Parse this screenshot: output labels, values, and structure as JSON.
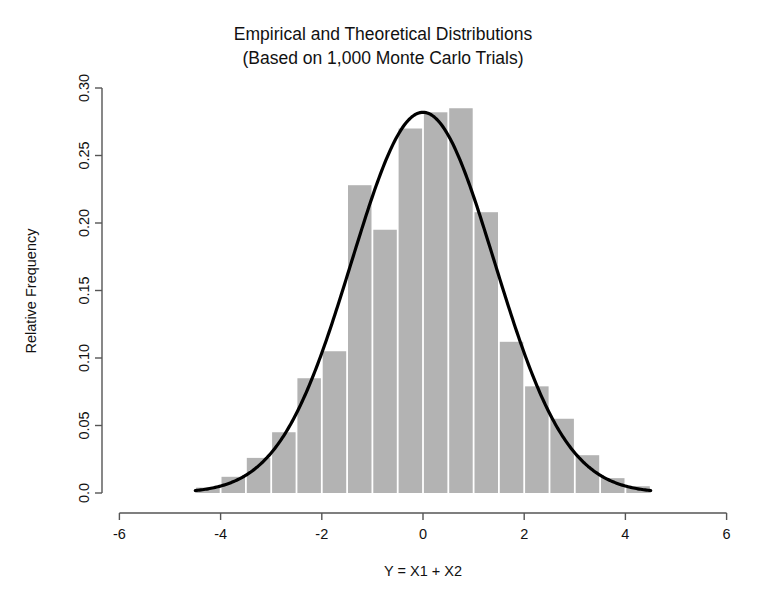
{
  "chart_data": {
    "type": "bar",
    "title": "Empirical and Theoretical Distributions",
    "subtitle": "(Based on 1,000 Monte Carlo Trials)",
    "title_line1": "Empirical and Theoretical Distributions",
    "title_line2": "(Based on 1,000 Monte Carlo Trials)",
    "xlabel": "Y = X1 + X2",
    "ylabel": "Relative Frequency",
    "xlim": [
      -6,
      6
    ],
    "ylim": [
      0.0,
      0.3
    ],
    "grid": false,
    "legend": "none",
    "bar_color": "#b3b3b3",
    "curve_color": "#000000",
    "axis_color": "#555555",
    "xticks": [
      -6,
      -4,
      -2,
      0,
      2,
      4,
      6
    ],
    "xtick_labels": [
      "-6",
      "-4",
      "-2",
      "0",
      "2",
      "4",
      "6"
    ],
    "yticks": [
      0.0,
      0.05,
      0.1,
      0.15,
      0.2,
      0.25,
      0.3
    ],
    "ytick_labels": [
      "0.0",
      "0.05",
      "0.10",
      "0.15",
      "0.20",
      "0.25",
      "0.30"
    ],
    "bin_width": 0.5,
    "bin_starts": [
      -4.5,
      -4.0,
      -3.5,
      -3.0,
      -2.5,
      -2.0,
      -1.5,
      -1.0,
      -0.5,
      0.0,
      0.5,
      1.0,
      1.5,
      2.0,
      2.5,
      3.0,
      3.5,
      4.0
    ],
    "bin_centers": [
      -4.25,
      -3.75,
      -3.25,
      -2.75,
      -2.25,
      -1.75,
      -1.25,
      -0.75,
      -0.25,
      0.25,
      0.75,
      1.25,
      1.75,
      2.25,
      2.75,
      3.25,
      3.75,
      4.25
    ],
    "categories": [
      "-4.5",
      "-4.0",
      "-3.5",
      "-3.0",
      "-2.5",
      "-2.0",
      "-1.5",
      "-1.0",
      "-0.5",
      "0.0",
      "0.5",
      "1.0",
      "1.5",
      "2.0",
      "2.5",
      "3.0",
      "3.5",
      "4.0"
    ],
    "values": [
      0.004,
      0.012,
      0.026,
      0.045,
      0.085,
      0.105,
      0.228,
      0.195,
      0.27,
      0.282,
      0.285,
      0.208,
      0.112,
      0.079,
      0.055,
      0.028,
      0.011,
      0.005
    ],
    "series": [
      {
        "name": "Empirical (histogram)",
        "values": [
          0.004,
          0.012,
          0.026,
          0.045,
          0.085,
          0.105,
          0.228,
          0.195,
          0.27,
          0.282,
          0.285,
          0.208,
          0.112,
          0.079,
          0.055,
          0.028,
          0.011,
          0.005
        ]
      },
      {
        "name": "Theoretical (normal density)",
        "type": "line",
        "mean": 0,
        "sd": 1.4142,
        "peak_value": 0.282,
        "x_range": [
          -4.5,
          4.5
        ]
      }
    ],
    "annotations": []
  },
  "figure": {
    "title_line1": "Empirical and Theoretical Distributions",
    "title_line2": "(Based on 1,000 Monte Carlo Trials)",
    "xlabel": "Y = X1 + X2",
    "ylabel": "Relative Frequency"
  }
}
